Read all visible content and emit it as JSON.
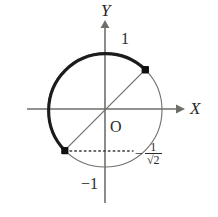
{
  "figure": {
    "kind": "unit-circle-diagram",
    "background_color": "#ffffff",
    "axes": {
      "x_label": "X",
      "y_label": "Y",
      "origin_label": "O",
      "axis_color": "#6f6f6a"
    },
    "labels": {
      "y_top": "1",
      "y_bottom": "−1",
      "x_dashed_minus": "−",
      "x_dashed_numerator": "1",
      "x_dashed_sqrt": "√2"
    },
    "colors": {
      "bold_arc": "#1c1c1c",
      "thin_arc": "#6f6f6a",
      "chord": "#6f6f6a",
      "dotted": "#3a3a3a",
      "marker": "#111111",
      "text": "#2b2b2b"
    },
    "geometry": {
      "center_x": 105,
      "center_y": 110,
      "radius": 57,
      "point_upper_right": {
        "x": 145,
        "y": 70,
        "angle_deg": 45
      },
      "point_lower_left": {
        "x": 66,
        "y": 151,
        "angle_deg": 225
      },
      "bold_arc_from_deg": 45,
      "bold_arc_to_deg": 225,
      "x_axis_y": 109,
      "x_axis_start": 27,
      "x_axis_end": 181,
      "y_axis_x": 105,
      "y_axis_top": 22,
      "y_axis_bottom": 203,
      "dotted_y": 151,
      "dotted_from_x": 70,
      "dotted_to_x": 133
    }
  }
}
